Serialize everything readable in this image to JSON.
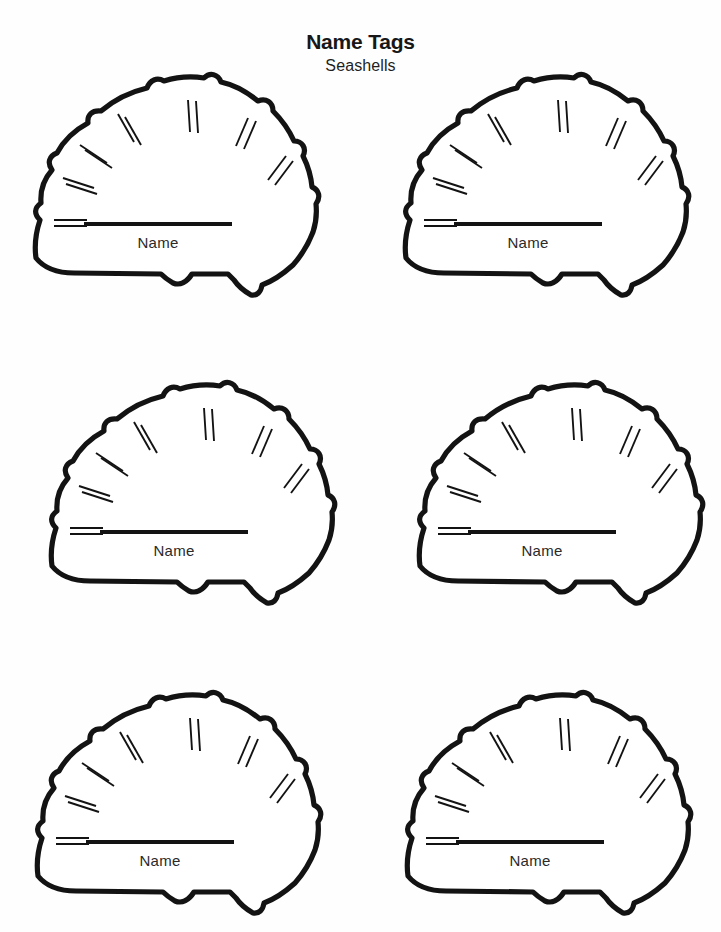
{
  "page": {
    "background_color": "#fefefe",
    "ink_color": "#131313",
    "width": 721,
    "height": 932
  },
  "header": {
    "title": "Name Tags",
    "subtitle": "Seashells"
  },
  "tag": {
    "name_label": "Name",
    "shape": "seashell",
    "ridge_pair_count": 7
  },
  "tags": [
    {
      "id": "tag-1",
      "row": 0,
      "col": 0,
      "name_label": "Name"
    },
    {
      "id": "tag-2",
      "row": 0,
      "col": 1,
      "name_label": "Name"
    },
    {
      "id": "tag-3",
      "row": 1,
      "col": 0,
      "name_label": "Name"
    },
    {
      "id": "tag-4",
      "row": 1,
      "col": 1,
      "name_label": "Name"
    },
    {
      "id": "tag-5",
      "row": 2,
      "col": 0,
      "name_label": "Name"
    },
    {
      "id": "tag-6",
      "row": 2,
      "col": 1,
      "name_label": "Name"
    }
  ]
}
